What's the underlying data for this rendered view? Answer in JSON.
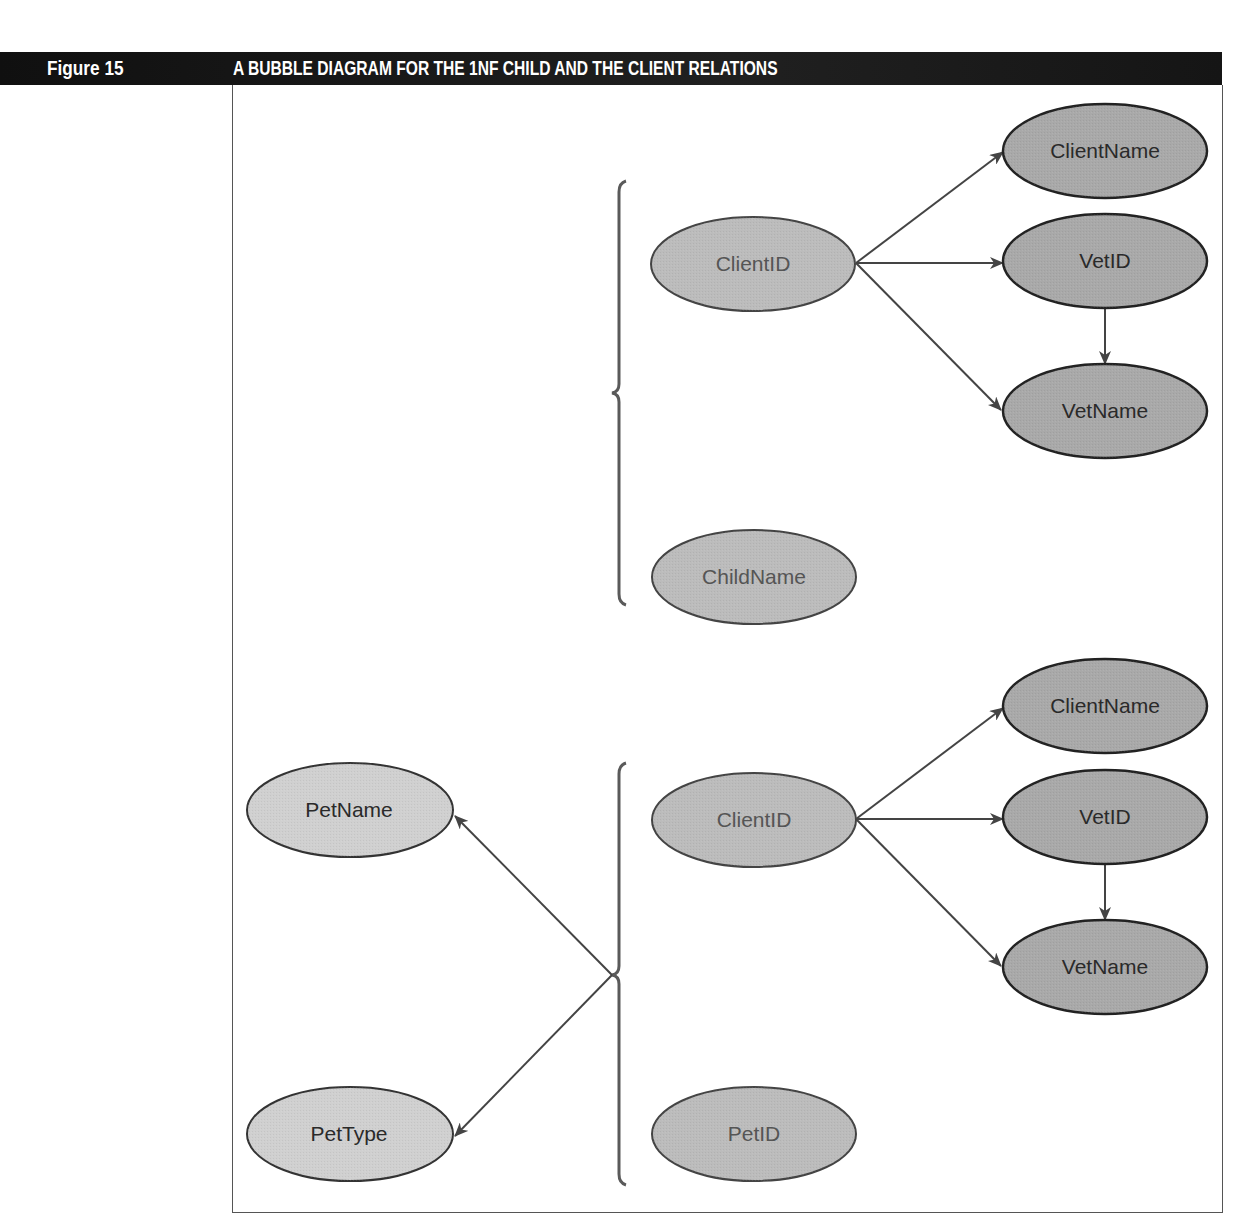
{
  "figure": {
    "number_label": "Figure 15",
    "title": "A BUBBLE DIAGRAM FOR THE 1NF CHILD AND THE CLIENT RELATIONS"
  },
  "colors": {
    "header_bg": "#141414",
    "header_text": "#ffffff",
    "key_fill": "#bcbcbc",
    "dependent_fill": "#a9a9a9",
    "pet_fill": "#d0d0d0",
    "stroke": "#333333",
    "arrow": "#444444",
    "brace": "#5a5a5a"
  },
  "diagram": {
    "child_relation": {
      "nodes": {
        "client_id": "ClientID",
        "client_name": "ClientName",
        "vet_id": "VetID",
        "vet_name": "VetName",
        "child_name": "ChildName"
      },
      "edges": [
        {
          "from": "ClientID",
          "to": "ClientName"
        },
        {
          "from": "ClientID",
          "to": "VetID"
        },
        {
          "from": "ClientID",
          "to": "VetName"
        },
        {
          "from": "VetID",
          "to": "VetName"
        }
      ],
      "composite_key": [
        "ClientID",
        "ChildName"
      ]
    },
    "client_relation": {
      "nodes": {
        "pet_name": "PetName",
        "pet_type": "PetType",
        "client_id": "ClientID",
        "client_name": "ClientName",
        "vet_id": "VetID",
        "vet_name": "VetName",
        "pet_id": "PetID"
      },
      "edges": [
        {
          "from": "ClientID",
          "to": "ClientName"
        },
        {
          "from": "ClientID",
          "to": "VetID"
        },
        {
          "from": "ClientID",
          "to": "VetName"
        },
        {
          "from": "VetID",
          "to": "VetName"
        },
        {
          "from": "{ClientID, PetID}",
          "to": "PetName"
        },
        {
          "from": "{ClientID, PetID}",
          "to": "PetType"
        }
      ],
      "composite_key": [
        "ClientID",
        "PetID"
      ]
    }
  }
}
